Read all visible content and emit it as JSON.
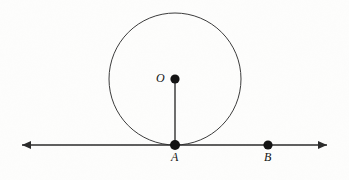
{
  "figure": {
    "kind": "geometry-diagram",
    "width": 349,
    "height": 180,
    "background_color": "#fdfdfc",
    "ink_color": "#141414",
    "stroke_color": "#3c3c3c"
  },
  "labels": {
    "center_point": "O",
    "tangent_point": "A",
    "line_point": "B"
  },
  "points": [
    {
      "name": "O",
      "label": "O",
      "x": 175,
      "y": 79,
      "dot_radius": 4.6,
      "role": "circle-center"
    },
    {
      "name": "A",
      "label": "A",
      "x": 175,
      "y": 145,
      "dot_radius": 5.0,
      "role": "tangent-point"
    },
    {
      "name": "B",
      "label": "B",
      "x": 268,
      "y": 145,
      "dot_radius": 4.6,
      "role": "point-on-line"
    }
  ],
  "circle": {
    "center_x": 175,
    "center_y": 79,
    "radius": 66,
    "stroke_width": 1.0,
    "stroke_color": "#3c3c3c",
    "fill": "none"
  },
  "radius_segment": {
    "from": "O",
    "to": "A",
    "x1": 175,
    "y1": 79,
    "x2": 175,
    "y2": 145,
    "stroke_width": 1.6,
    "stroke_color": "#4a4a4a"
  },
  "tangent_line": {
    "y": 145,
    "x_start": 22,
    "x_end": 327,
    "stroke_width": 1.3,
    "stroke_color": "#2b2b2b",
    "arrow_left": true,
    "arrow_right": true,
    "arrow_length": 9,
    "arrow_half_width": 4
  }
}
